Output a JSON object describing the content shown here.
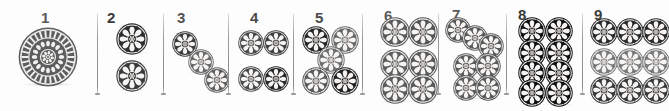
{
  "plate": {
    "title": "Rosette motif plate",
    "width": 669,
    "height": 111,
    "background": "#ffffff",
    "separator_color": "#8c8c8c",
    "label_color": "#4a4a4a"
  },
  "panels": [
    {
      "number": "1",
      "x": 0,
      "width": 97,
      "label_x": 41,
      "label_y": 10,
      "tone": "#5a5a5a",
      "arrangement": "single-large-mandala",
      "count": 1,
      "motifs": [
        {
          "cx": 48,
          "cy": 57,
          "r": 30,
          "style": "mandala",
          "tone": "#5e5e5e"
        }
      ]
    },
    {
      "number": "2",
      "x": 97,
      "width": 66,
      "label_x": 10,
      "label_y": 10,
      "tone": "#3a3a3a",
      "arrangement": "vertical-pair",
      "count": 2,
      "motifs": [
        {
          "cx": 35,
          "cy": 39,
          "r": 16,
          "style": "rosette",
          "tone": "#2e2e2e"
        },
        {
          "cx": 35,
          "cy": 76,
          "r": 16,
          "style": "rosette",
          "tone": "#3c3c3c"
        }
      ]
    },
    {
      "number": "3",
      "x": 163,
      "width": 65,
      "label_x": 14,
      "label_y": 10,
      "tone": "#545454",
      "arrangement": "diagonal-three",
      "count": 3,
      "motifs": [
        {
          "cx": 22,
          "cy": 44,
          "r": 13,
          "style": "rosette",
          "tone": "#3b3b3b"
        },
        {
          "cx": 38,
          "cy": 62,
          "r": 13,
          "style": "rosette",
          "tone": "#6a6a6a"
        },
        {
          "cx": 54,
          "cy": 80,
          "r": 13,
          "style": "rosette",
          "tone": "#5f5f5f"
        }
      ]
    },
    {
      "number": "4",
      "x": 228,
      "width": 65,
      "label_x": 22,
      "label_y": 10,
      "tone": "#4a4a4a",
      "arrangement": "grid-2x2",
      "count": 4,
      "motifs": [
        {
          "cx": 23,
          "cy": 43,
          "r": 13,
          "style": "rosette",
          "tone": "#4a4a4a"
        },
        {
          "cx": 48,
          "cy": 43,
          "r": 13,
          "style": "rosette",
          "tone": "#3f3f3f"
        },
        {
          "cx": 23,
          "cy": 79,
          "r": 13,
          "style": "rosette",
          "tone": "#4a4a4a"
        },
        {
          "cx": 48,
          "cy": 79,
          "r": 13,
          "style": "rosette",
          "tone": "#262626"
        }
      ]
    },
    {
      "number": "5",
      "x": 293,
      "width": 69,
      "label_x": 22,
      "label_y": 10,
      "tone": "#4a4a4a",
      "arrangement": "quincunx",
      "count": 5,
      "motifs": [
        {
          "cx": 23,
          "cy": 40,
          "r": 14,
          "style": "rosette",
          "tone": "#262626"
        },
        {
          "cx": 52,
          "cy": 40,
          "r": 14,
          "style": "rosette",
          "tone": "#6a6a6a"
        },
        {
          "cx": 38,
          "cy": 60,
          "r": 14,
          "style": "rosette",
          "tone": "#6e6e6e"
        },
        {
          "cx": 23,
          "cy": 81,
          "r": 14,
          "style": "rosette",
          "tone": "#5a5a5a"
        },
        {
          "cx": 52,
          "cy": 81,
          "r": 14,
          "style": "rosette",
          "tone": "#222222"
        }
      ]
    },
    {
      "number": "6",
      "x": 362,
      "width": 76,
      "label_x": 22,
      "label_y": 8,
      "tone": "#5a5a5a",
      "arrangement": "two-over-four",
      "count": 6,
      "motifs": [
        {
          "cx": 33,
          "cy": 32,
          "r": 15,
          "style": "rosette",
          "tone": "#5a5a5a"
        },
        {
          "cx": 61,
          "cy": 32,
          "r": 15,
          "style": "rosette",
          "tone": "#555555"
        },
        {
          "cx": 33,
          "cy": 64,
          "r": 15,
          "style": "rosette",
          "tone": "#5e5e5e"
        },
        {
          "cx": 61,
          "cy": 64,
          "r": 15,
          "style": "rosette",
          "tone": "#5a5a5a"
        },
        {
          "cx": 33,
          "cy": 89,
          "r": 15,
          "style": "rosette",
          "tone": "#5c5c5c"
        },
        {
          "cx": 61,
          "cy": 89,
          "r": 15,
          "style": "rosette",
          "tone": "#585858"
        }
      ]
    },
    {
      "number": "7",
      "x": 438,
      "width": 68,
      "label_x": 14,
      "label_y": 7,
      "tone": "#5a5a5a",
      "arrangement": "three-diagonal-over-four",
      "count": 7,
      "motifs": [
        {
          "cx": 20,
          "cy": 30,
          "r": 13,
          "style": "rosette",
          "tone": "#585858"
        },
        {
          "cx": 37,
          "cy": 38,
          "r": 13,
          "style": "rosette",
          "tone": "#5a5a5a"
        },
        {
          "cx": 53,
          "cy": 46,
          "r": 13,
          "style": "rosette",
          "tone": "#565656"
        },
        {
          "cx": 28,
          "cy": 66,
          "r": 13,
          "style": "rosette",
          "tone": "#5a5a5a"
        },
        {
          "cx": 50,
          "cy": 66,
          "r": 13,
          "style": "rosette",
          "tone": "#5a5a5a"
        },
        {
          "cx": 28,
          "cy": 88,
          "r": 13,
          "style": "rosette",
          "tone": "#5c5c5c"
        },
        {
          "cx": 50,
          "cy": 88,
          "r": 13,
          "style": "rosette",
          "tone": "#585858"
        }
      ]
    },
    {
      "number": "8",
      "x": 506,
      "width": 76,
      "label_x": 12,
      "label_y": 7,
      "tone": "#3a3a3a",
      "arrangement": "grid-2x4",
      "count": 8,
      "motifs": [
        {
          "cx": 26,
          "cy": 31,
          "r": 14,
          "style": "rosette",
          "tone": "#111111"
        },
        {
          "cx": 53,
          "cy": 31,
          "r": 14,
          "style": "rosette",
          "tone": "#111111"
        },
        {
          "cx": 26,
          "cy": 53,
          "r": 14,
          "style": "rosette",
          "tone": "#111111"
        },
        {
          "cx": 53,
          "cy": 53,
          "r": 14,
          "style": "rosette",
          "tone": "#111111"
        },
        {
          "cx": 26,
          "cy": 73,
          "r": 14,
          "style": "rosette",
          "tone": "#111111"
        },
        {
          "cx": 53,
          "cy": 73,
          "r": 14,
          "style": "rosette",
          "tone": "#111111"
        },
        {
          "cx": 26,
          "cy": 93,
          "r": 14,
          "style": "rosette",
          "tone": "#111111"
        },
        {
          "cx": 53,
          "cy": 93,
          "r": 14,
          "style": "rosette",
          "tone": "#111111"
        }
      ]
    },
    {
      "number": "9",
      "x": 582,
      "width": 87,
      "label_x": 12,
      "label_y": 7,
      "tone": "#3c3c3c",
      "arrangement": "grid-3x3",
      "count": 9,
      "motifs": [
        {
          "cx": 22,
          "cy": 32,
          "r": 14,
          "style": "rosette",
          "tone": "#2b2b2b"
        },
        {
          "cx": 48,
          "cy": 32,
          "r": 14,
          "style": "rosette",
          "tone": "#2b2b2b"
        },
        {
          "cx": 74,
          "cy": 32,
          "r": 14,
          "style": "rosette",
          "tone": "#2b2b2b"
        },
        {
          "cx": 22,
          "cy": 62,
          "r": 14,
          "style": "rosette",
          "tone": "#7a7a7a"
        },
        {
          "cx": 48,
          "cy": 62,
          "r": 14,
          "style": "rosette",
          "tone": "#7a7a7a"
        },
        {
          "cx": 74,
          "cy": 62,
          "r": 14,
          "style": "rosette",
          "tone": "#7a7a7a"
        },
        {
          "cx": 22,
          "cy": 90,
          "r": 14,
          "style": "rosette",
          "tone": "#3a3a3a"
        },
        {
          "cx": 48,
          "cy": 90,
          "r": 14,
          "style": "rosette",
          "tone": "#3a3a3a"
        },
        {
          "cx": 74,
          "cy": 90,
          "r": 14,
          "style": "rosette",
          "tone": "#3a3a3a"
        }
      ]
    }
  ],
  "separators": [
    {
      "x": 97
    },
    {
      "x": 163
    },
    {
      "x": 228
    },
    {
      "x": 293
    },
    {
      "x": 362
    },
    {
      "x": 438
    },
    {
      "x": 506
    },
    {
      "x": 582
    }
  ]
}
